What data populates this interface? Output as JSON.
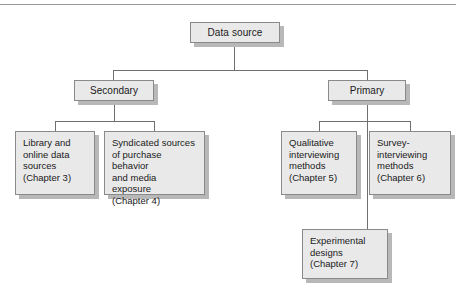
{
  "diagram": {
    "type": "hierarchy-tree",
    "colors": {
      "node_fill": "#e9e9e9",
      "node_border": "#8a8a8a",
      "node_shadow": "#b8b8b8",
      "connector": "#6f6f6f",
      "text": "#1a1a1a",
      "background": "#ffffff"
    },
    "nodes": {
      "root": {
        "label": "Data source",
        "level": 1
      },
      "secondary": {
        "label": "Secondary",
        "level": 2
      },
      "primary": {
        "label": "Primary",
        "level": 2
      },
      "library": {
        "label": "Library and\nonline data\nsources\n(Chapter 3)",
        "chapter": "Chapter 3",
        "level": 3
      },
      "syndicated": {
        "label": "Syndicated sources\nof purchase behavior\nand media exposure\n(Chapter 4)",
        "chapter": "Chapter 4",
        "level": 3
      },
      "qualitative": {
        "label": "Qualitative\ninterviewing\nmethods\n(Chapter 5)",
        "chapter": "Chapter 5",
        "level": 3
      },
      "survey": {
        "label": "Survey-\ninterviewing\nmethods\n(Chapter 6)",
        "chapter": "Chapter 6",
        "level": 3
      },
      "experimental": {
        "label": "Experimental\ndesigns\n(Chapter 7)",
        "chapter": "Chapter 7",
        "level": 4
      }
    },
    "edges": [
      {
        "from": "root",
        "to": "secondary"
      },
      {
        "from": "root",
        "to": "primary"
      },
      {
        "from": "secondary",
        "to": "library"
      },
      {
        "from": "secondary",
        "to": "syndicated"
      },
      {
        "from": "primary",
        "to": "qualitative"
      },
      {
        "from": "primary",
        "to": "survey"
      },
      {
        "from": "primary",
        "to": "experimental"
      }
    ]
  }
}
